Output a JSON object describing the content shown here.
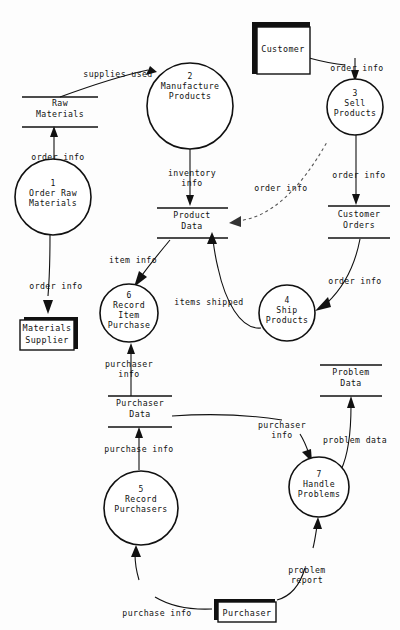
{
  "diagram": {
    "type": "data-flow-diagram",
    "title": "",
    "processes": [
      {
        "id": "p1",
        "number": "1",
        "name_lines": [
          "Order Raw",
          "Materials"
        ],
        "cx": 53,
        "cy": 197,
        "r": 38
      },
      {
        "id": "p2",
        "number": "2",
        "name_lines": [
          "Manufacture",
          "Products"
        ],
        "cx": 190,
        "cy": 106,
        "r": 43
      },
      {
        "id": "p3",
        "number": "3",
        "name_lines": [
          "Sell",
          "Products"
        ],
        "cx": 355,
        "cy": 107,
        "r": 28
      },
      {
        "id": "p4",
        "number": "4",
        "name_lines": [
          "Ship",
          "Products"
        ],
        "cx": 287,
        "cy": 313,
        "r": 28
      },
      {
        "id": "p5",
        "number": "5",
        "name_lines": [
          "Record",
          "Purchasers"
        ],
        "cx": 141,
        "cy": 508,
        "r": 37
      },
      {
        "id": "p6",
        "number": "6",
        "name_lines": [
          "Record",
          "Item",
          "Purchase"
        ],
        "cx": 129,
        "cy": 313,
        "r": 29
      },
      {
        "id": "p7",
        "number": "7",
        "name_lines": [
          "Handle",
          "Problems"
        ],
        "cx": 319,
        "cy": 487,
        "r": 30
      }
    ],
    "data_stores": [
      {
        "id": "ds-raw-materials",
        "name_lines": [
          "Raw",
          "Materials"
        ],
        "x": 22,
        "y": 97,
        "w": 76,
        "h": 30
      },
      {
        "id": "ds-product-data",
        "name_lines": [
          "Product",
          "Data"
        ],
        "x": 157,
        "y": 208,
        "w": 71,
        "h": 30
      },
      {
        "id": "ds-customer-orders",
        "name_lines": [
          "Customer",
          "Orders"
        ],
        "x": 328,
        "y": 206,
        "w": 62,
        "h": 32
      },
      {
        "id": "ds-purchaser-data",
        "name_lines": [
          "Purchaser",
          "Data"
        ],
        "x": 108,
        "y": 396,
        "w": 64,
        "h": 31
      },
      {
        "id": "ds-problem-data",
        "name_lines": [
          "Problem",
          "Data"
        ],
        "x": 320,
        "y": 365,
        "w": 62,
        "h": 31
      }
    ],
    "external_entities": [
      {
        "id": "ee-customer",
        "name": "Customer",
        "x": 252,
        "y": 22,
        "w": 58,
        "h": 52
      },
      {
        "id": "ee-materials-supplier",
        "name_lines": [
          "Materials",
          "Supplier"
        ],
        "x": 24,
        "y": 317,
        "w": 54,
        "h": 32
      },
      {
        "id": "ee-purchaser",
        "name": "Purchaser",
        "x": 214,
        "y": 599,
        "w": 61,
        "h": 21
      }
    ],
    "flows": [
      {
        "id": "f-supplies-used",
        "label": "supplies used",
        "from": "ds-raw-materials",
        "to": "p2",
        "label_x": 118,
        "label_y": 77,
        "style": "solid"
      },
      {
        "id": "f-order-info-1-raw",
        "label": "order info",
        "from": "p1",
        "to": "ds-raw-materials",
        "label_x": 58,
        "label_y": 157,
        "style": "solid"
      },
      {
        "id": "f-order-info-1-supplier",
        "label": "order info",
        "from": "p1",
        "to": "ee-materials-supplier",
        "label_x": 56,
        "label_y": 288,
        "style": "solid"
      },
      {
        "id": "f-inventory-info",
        "label_lines": [
          "inventory",
          "info"
        ],
        "from": "p2",
        "to": "ds-product-data",
        "label_x": 192,
        "label_y": 177,
        "style": "solid"
      },
      {
        "id": "f-order-info-customer",
        "label": "order info",
        "from": "ee-customer",
        "to": "p3",
        "label_x": 357,
        "label_y": 70,
        "style": "solid"
      },
      {
        "id": "f-order-info-3-orders",
        "label": "order info",
        "from": "p3",
        "to": "ds-customer-orders",
        "label_x": 359,
        "label_y": 175,
        "style": "solid"
      },
      {
        "id": "f-order-info-product-sell",
        "label": "order info",
        "from": "ds-product-data",
        "to": "p3",
        "label_x": 281,
        "label_y": 188,
        "style": "dashed"
      },
      {
        "id": "f-order-info-orders-ship",
        "label": "order info",
        "from": "ds-customer-orders",
        "to": "p4",
        "label_x": 358,
        "label_y": 281,
        "style": "solid"
      },
      {
        "id": "f-items-shipped",
        "label": "items shipped",
        "from": "p4",
        "to": "ds-product-data",
        "label_x": 208,
        "label_y": 302,
        "style": "solid"
      },
      {
        "id": "f-item-info",
        "label": "item info",
        "from": "ds-product-data",
        "to": "p6",
        "label_x": 131,
        "label_y": 261,
        "style": "solid"
      },
      {
        "id": "f-purchaser-info-6",
        "label_lines": [
          "purchaser",
          "info"
        ],
        "from": "ds-purchaser-data",
        "to": "p6",
        "label_x": 129,
        "label_y": 366,
        "style": "solid"
      },
      {
        "id": "f-purchase-info-5-store",
        "label": "purchase info",
        "from": "p5",
        "to": "ds-purchaser-data",
        "label_x": 139,
        "label_y": 449,
        "style": "solid"
      },
      {
        "id": "f-purchaser-info-7",
        "label_lines": [
          "purchaser",
          "info"
        ],
        "from": "ds-purchaser-data",
        "to": "p7",
        "label_x": 282,
        "label_y": 427,
        "style": "solid"
      },
      {
        "id": "f-problem-data",
        "label": "problem data",
        "from": "p7",
        "to": "ds-problem-data",
        "label_x": 355,
        "label_y": 440,
        "style": "solid"
      },
      {
        "id": "f-problem-report",
        "label_lines": [
          "problem",
          "report"
        ],
        "from": "ee-purchaser",
        "to": "p7",
        "label_x": 306,
        "label_y": 572,
        "style": "solid"
      },
      {
        "id": "f-purchase-info-purchaser-5",
        "label": "purchase info",
        "from": "ee-purchaser",
        "to": "p5",
        "label_x": 155,
        "label_y": 614,
        "style": "solid"
      }
    ]
  }
}
